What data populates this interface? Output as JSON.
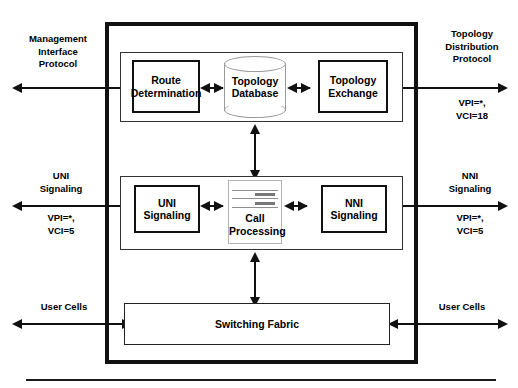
{
  "diagram": {
    "colors": {
      "ink": "#111111",
      "panel_outline": "#333333",
      "cylinder_outline": "#9a9a9a",
      "server_outline": "#b4b4b4",
      "background": "#ffffff"
    },
    "chassis": {
      "label": "switch-chassis"
    },
    "panels": {
      "routing": {
        "label": "routing-panel"
      },
      "signaling": {
        "label": "signaling-panel"
      },
      "fabric": {
        "label": "fabric-panel"
      }
    },
    "blocks": {
      "route_determination": "Route\nDetermination",
      "topology_database": "Topology\nDatabase",
      "topology_exchange": "Topology\nExchange",
      "uni_signaling": "UNI\nSignaling",
      "call_processing": "Call\nProcessing",
      "nni_signaling": "NNI\nSignaling",
      "switching_fabric": "Switching Fabric"
    },
    "interfaces": {
      "left_top": {
        "name": "Management\nInterface\nProtocol",
        "vc": ""
      },
      "right_top": {
        "name": "Topology\nDistribution\nProtocol",
        "vc": "VPI=*,\nVCI=18"
      },
      "left_mid": {
        "name": "UNI\nSignaling",
        "vc": "VPI=*,\nVCI=5"
      },
      "right_mid": {
        "name": "NNI\nSignaling",
        "vc": "VPI=*,\nVCI=5"
      },
      "left_bottom": {
        "name": "User Cells",
        "vc": ""
      },
      "right_bottom": {
        "name": "User Cells",
        "vc": ""
      }
    }
  }
}
